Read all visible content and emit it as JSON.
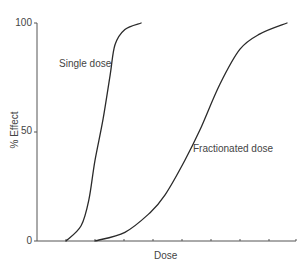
{
  "chart_data": {
    "type": "line",
    "title": "",
    "xlabel": "Dose",
    "ylabel": "% Effect",
    "yticks": [
      "0",
      "50",
      "100"
    ],
    "ylim": [
      0,
      100
    ],
    "xlim": [
      0,
      9
    ],
    "x_tick_count": 9,
    "x_tick_labels": [],
    "grid": false,
    "legend": "inline annotations",
    "series": [
      {
        "name": "Single dose",
        "x": [
          1.0,
          1.52,
          1.79,
          2.0,
          2.28,
          2.52,
          2.69,
          3.03,
          3.59
        ],
        "values": [
          0,
          7,
          19,
          37,
          56,
          76,
          90,
          97,
          100
        ]
      },
      {
        "name": "Fractionated dose",
        "x": [
          2.0,
          3.03,
          3.9,
          4.41,
          5.1,
          5.62,
          6.31,
          7.0,
          7.69,
          8.62
        ],
        "values": [
          0,
          4,
          13,
          21,
          37,
          51,
          72,
          88,
          95,
          100
        ]
      }
    ],
    "annotations": [
      {
        "text": "Single dose",
        "near_series": "Single dose"
      },
      {
        "text": "Fractionated dose",
        "near_series": "Fractionated dose"
      }
    ]
  },
  "labels": {
    "xlabel": "Dose",
    "ylabel": "% Effect",
    "y0": "0",
    "y50": "50",
    "y100": "100",
    "single": "Single dose",
    "fractionated": "Fractionated dose"
  },
  "colors": {
    "line": "#2a2a2a",
    "axis": "#555555",
    "text": "#444444"
  }
}
